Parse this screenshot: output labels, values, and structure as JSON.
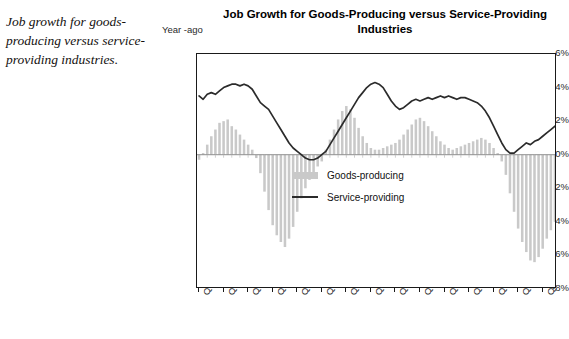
{
  "caption": "Job growth for goods-producing versus service-providing industries.",
  "chart": {
    "title": "Job Growth for Goods-Producing versus Service-Providing Industries",
    "unit_label": "Year -ago",
    "legend": [
      {
        "label": "Goods-producing",
        "type": "bar",
        "color": "#c9c9c9"
      },
      {
        "label": "Service-providing",
        "type": "line",
        "color": "#2b2b2b"
      }
    ]
  },
  "chart_data": {
    "type": "bar",
    "title": "Job Growth for Goods-Producing versus Service-Providing Industries",
    "xlabel": "",
    "ylabel": "Year -ago",
    "ylim": [
      -8,
      6
    ],
    "ytick_labels": [
      "6%",
      "4%",
      "2%",
      "0%",
      "-2%",
      "-4%",
      "-6%",
      "-8%"
    ],
    "ytick_values": [
      6,
      4,
      2,
      0,
      -2,
      -4,
      -6,
      -8
    ],
    "grid": false,
    "legend_position": "inside-center",
    "xtick_labels": [
      "Q1-87",
      "Q3-88",
      "Q1-90",
      "Q3-91",
      "Q1-93",
      "Q3-94",
      "Q1-96",
      "Q3-97",
      "Q1-99",
      "Q3-00",
      "Q1-02",
      "Q3-03",
      "Q1-05",
      "Q3-06",
      "Q1-08"
    ],
    "xtick_indices": [
      0,
      6,
      12,
      18,
      24,
      30,
      36,
      42,
      48,
      54,
      60,
      66,
      72,
      78,
      84
    ],
    "categories": [
      "Q1-87",
      "Q2-87",
      "Q3-87",
      "Q4-87",
      "Q1-88",
      "Q2-88",
      "Q3-88",
      "Q4-88",
      "Q1-89",
      "Q2-89",
      "Q3-89",
      "Q4-89",
      "Q1-90",
      "Q2-90",
      "Q3-90",
      "Q4-90",
      "Q1-91",
      "Q2-91",
      "Q3-91",
      "Q4-91",
      "Q1-92",
      "Q2-92",
      "Q3-92",
      "Q4-92",
      "Q1-93",
      "Q2-93",
      "Q3-93",
      "Q4-93",
      "Q1-94",
      "Q2-94",
      "Q3-94",
      "Q4-94",
      "Q1-95",
      "Q2-95",
      "Q3-95",
      "Q4-95",
      "Q1-96",
      "Q2-96",
      "Q3-96",
      "Q4-96",
      "Q1-97",
      "Q2-97",
      "Q3-97",
      "Q4-97",
      "Q1-98",
      "Q2-98",
      "Q3-98",
      "Q4-98",
      "Q1-99",
      "Q2-99",
      "Q3-99",
      "Q4-99",
      "Q1-00",
      "Q2-00",
      "Q3-00",
      "Q4-00",
      "Q1-01",
      "Q2-01",
      "Q3-01",
      "Q4-01",
      "Q1-02",
      "Q2-02",
      "Q3-02",
      "Q4-02",
      "Q1-03",
      "Q2-03",
      "Q3-03",
      "Q4-03",
      "Q1-04",
      "Q2-04",
      "Q3-04",
      "Q4-04",
      "Q1-05",
      "Q2-05",
      "Q3-05",
      "Q4-05",
      "Q1-06",
      "Q2-06",
      "Q3-06",
      "Q4-06",
      "Q1-07",
      "Q2-07",
      "Q3-07",
      "Q4-07",
      "Q1-08",
      "Q2-08",
      "Q3-08",
      "Q4-08"
    ],
    "series": [
      {
        "name": "Goods-producing",
        "type": "bar",
        "color": "#c9c9c9",
        "values": [
          -0.3,
          0.1,
          0.6,
          1.1,
          1.5,
          1.9,
          2.0,
          2.1,
          1.7,
          1.5,
          1.2,
          0.9,
          0.6,
          0.3,
          -0.2,
          -1.1,
          -2.2,
          -3.3,
          -4.2,
          -4.8,
          -5.2,
          -5.5,
          -5.0,
          -4.3,
          -3.4,
          -2.6,
          -2.0,
          -1.5,
          -1.1,
          -0.7,
          -0.4,
          0.3,
          0.9,
          1.5,
          2.1,
          2.6,
          2.9,
          2.7,
          2.2,
          1.6,
          1.1,
          0.7,
          0.4,
          0.3,
          0.3,
          0.4,
          0.5,
          0.6,
          0.7,
          0.9,
          1.2,
          1.5,
          1.8,
          2.1,
          2.2,
          2.0,
          1.7,
          1.4,
          1.1,
          0.8,
          0.6,
          0.4,
          0.3,
          0.4,
          0.5,
          0.6,
          0.7,
          0.8,
          0.9,
          1.0,
          0.9,
          0.7,
          0.4,
          0.1,
          -0.4,
          -1.2,
          -2.3,
          -3.4,
          -4.4,
          -5.2,
          -5.8,
          -6.3,
          -6.4,
          -6.1,
          -5.6,
          -5.0,
          -4.5,
          -4.0
        ]
      },
      {
        "name": "Service-providing",
        "type": "line",
        "color": "#2b2b2b",
        "values": [
          3.5,
          3.3,
          3.6,
          3.7,
          3.6,
          3.8,
          4.0,
          4.1,
          4.2,
          4.2,
          4.1,
          4.2,
          4.1,
          3.9,
          3.5,
          3.1,
          2.9,
          2.7,
          2.3,
          1.9,
          1.5,
          1.1,
          0.7,
          0.4,
          0.2,
          0.0,
          -0.2,
          -0.3,
          -0.3,
          -0.2,
          0.0,
          0.2,
          0.6,
          1.0,
          1.4,
          1.8,
          2.2,
          2.6,
          3.0,
          3.4,
          3.7,
          4.0,
          4.2,
          4.3,
          4.2,
          4.0,
          3.6,
          3.2,
          2.9,
          2.7,
          2.8,
          3.0,
          3.2,
          3.3,
          3.2,
          3.3,
          3.4,
          3.3,
          3.4,
          3.5,
          3.4,
          3.5,
          3.4,
          3.3,
          3.4,
          3.4,
          3.3,
          3.2,
          3.1,
          2.9,
          2.6,
          2.2,
          1.7,
          1.2,
          0.7,
          0.3,
          0.1,
          0.1,
          0.3,
          0.5,
          0.7,
          0.6,
          0.8,
          0.9,
          1.1,
          1.3,
          1.5,
          1.7
        ]
      }
    ],
    "extended_service_values": [
      3.5,
      3.3,
      3.6,
      3.7,
      3.6,
      3.8,
      4.0,
      4.1,
      4.2,
      4.2,
      4.1,
      4.2,
      4.1,
      3.9,
      3.5,
      3.1,
      2.9,
      2.7,
      2.3,
      1.9,
      1.5,
      1.1,
      0.7,
      0.4,
      0.2,
      0.0,
      -0.2,
      -0.3,
      -0.3,
      -0.2,
      0.0,
      0.2,
      0.6,
      1.0,
      1.4,
      1.8,
      2.2,
      2.6,
      3.0,
      3.4,
      3.7,
      4.0,
      4.2,
      4.3,
      4.2,
      4.0,
      3.6,
      3.2,
      2.9,
      2.7,
      2.8,
      3.0,
      3.2,
      3.3,
      3.2,
      3.3,
      3.4,
      3.3,
      3.4,
      3.5,
      3.4,
      3.5,
      3.4,
      3.3,
      3.4,
      3.4,
      3.3,
      3.2,
      3.1,
      2.9,
      2.6,
      2.2,
      1.7,
      1.2,
      0.7,
      0.3,
      0.1,
      0.1,
      0.3,
      0.5,
      0.7,
      0.6,
      0.8,
      0.9,
      1.1,
      1.3,
      1.5,
      1.7
    ],
    "annotations": [
      {
        "text": "1990-91 recession trough",
        "category": "Q2-92"
      },
      {
        "text": "2001-02 recession trough",
        "category": "Q3-02"
      }
    ]
  }
}
